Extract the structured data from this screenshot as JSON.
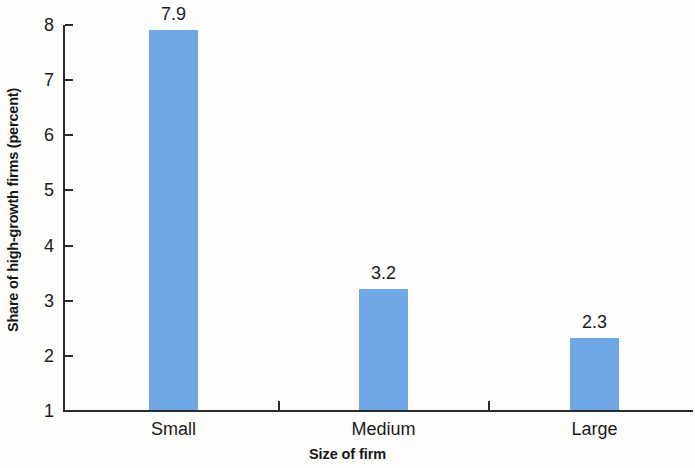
{
  "chart_data": {
    "type": "bar",
    "title": "",
    "subtitle": "",
    "xlabel": "Size of firm",
    "ylabel": "Share of high-growth firms (percent)",
    "categories": [
      "Small",
      "Medium",
      "Large"
    ],
    "values": [
      7.9,
      3.2,
      2.3
    ],
    "value_labels": [
      "7.9",
      "3.2",
      "2.3"
    ],
    "ylim": [
      1,
      8
    ],
    "yticks": [
      1,
      2,
      3,
      4,
      5,
      6,
      7,
      8
    ],
    "ytick_labels": [
      "1",
      "2",
      "3",
      "4",
      "5",
      "6",
      "7",
      "8"
    ],
    "grid": false,
    "legend": null,
    "legend_position": "none",
    "bar_color": "#6fa8e4",
    "axis_color": "#2b2b2b",
    "text_color": "#1b1b1b",
    "background_color": "#fdfdfc"
  }
}
